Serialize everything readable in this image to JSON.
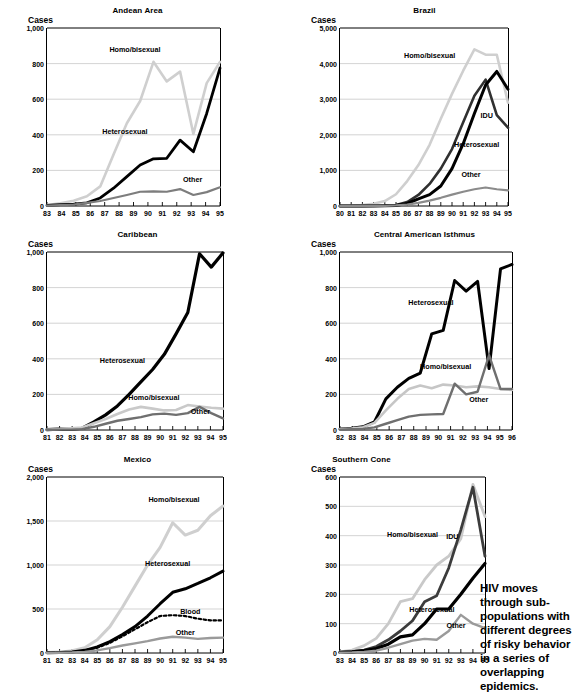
{
  "caption": {
    "text": "HIV moves through sub-populations with different degrees of risky behavior in a series of overlapping epidemics."
  },
  "axis_name_label": "Cases",
  "charts": [
    {
      "id": "andean-area",
      "title": "Andean Area",
      "ylabel": "Cases",
      "ylim": [
        0,
        1000
      ],
      "yticks": [
        0,
        200,
        400,
        600,
        800,
        1000
      ],
      "ytick_labels": [
        "0",
        "200",
        "400",
        "600",
        "800",
        "1,000"
      ],
      "xticks": [
        "83",
        "84",
        "85",
        "86",
        "87",
        "88",
        "89",
        "90",
        "91",
        "92",
        "93",
        "94",
        "95"
      ],
      "series": [
        {
          "name": "Homo/bisexual",
          "color": "#cfcfcf",
          "width": 2.6,
          "label_x": 89.1,
          "label_y": 880,
          "values": [
            5,
            15,
            30,
            55,
            110,
            290,
            465,
            590,
            810,
            700,
            755,
            405,
            690,
            810
          ]
        },
        {
          "name": "Heterosexual",
          "color": "#000000",
          "width": 2.8,
          "label_x": 88.4,
          "label_y": 420,
          "values": [
            3,
            8,
            10,
            18,
            45,
            100,
            165,
            230,
            265,
            268,
            370,
            305,
            520,
            775
          ]
        },
        {
          "name": "Other",
          "color": "#7d7d7d",
          "width": 2.2,
          "label_x": 93.1,
          "label_y": 150,
          "values": [
            2,
            5,
            8,
            18,
            28,
            45,
            62,
            80,
            82,
            80,
            95,
            62,
            78,
            105
          ]
        }
      ]
    },
    {
      "id": "brazil",
      "title": "Brazil",
      "ylabel": "Cases",
      "ylim": [
        0,
        5000
      ],
      "yticks": [
        0,
        1000,
        2000,
        3000,
        4000,
        5000
      ],
      "ytick_labels": [
        "0",
        "1,000",
        "2,000",
        "3,000",
        "4,000",
        "5,000"
      ],
      "xticks": [
        "80",
        "81",
        "82",
        "83",
        "84",
        "85",
        "86",
        "87",
        "88",
        "89",
        "90",
        "91",
        "92",
        "93",
        "94",
        "95"
      ],
      "series": [
        {
          "name": "Homo/bisexual",
          "color": "#cfcfcf",
          "width": 2.6,
          "label_x": 88.0,
          "label_y": 4230,
          "values": [
            5,
            10,
            25,
            60,
            140,
            330,
            700,
            1150,
            1720,
            2450,
            3150,
            3800,
            4400,
            4250,
            4250,
            2900
          ]
        },
        {
          "name": "IDU",
          "color": "#303030",
          "width": 2.6,
          "label_x": 93.1,
          "label_y": 2550,
          "values": [
            0,
            0,
            2,
            5,
            12,
            25,
            110,
            310,
            620,
            1050,
            1600,
            2350,
            3100,
            3550,
            2550,
            2200
          ]
        },
        {
          "name": "Heterosexual",
          "color": "#000000",
          "width": 3.0,
          "label_x": 92.2,
          "label_y": 1730,
          "values": [
            0,
            0,
            0,
            2,
            5,
            15,
            70,
            200,
            320,
            560,
            1050,
            1750,
            2600,
            3400,
            3780,
            3280
          ]
        },
        {
          "name": "Other",
          "color": "#8b8b8b",
          "width": 2.2,
          "label_x": 91.7,
          "label_y": 900,
          "values": [
            0,
            0,
            0,
            2,
            5,
            15,
            40,
            90,
            150,
            230,
            320,
            400,
            470,
            520,
            470,
            440
          ]
        }
      ]
    },
    {
      "id": "caribbean",
      "title": "Caribbean",
      "ylabel": "Cases",
      "ylim": [
        0,
        1000
      ],
      "yticks": [
        0,
        200,
        400,
        600,
        800,
        1000
      ],
      "ytick_labels": [
        "0",
        "200",
        "400",
        "600",
        "800",
        "1,000"
      ],
      "xticks": [
        "81",
        "82",
        "83",
        "84",
        "85",
        "86",
        "87",
        "88",
        "89",
        "90",
        "91",
        "92",
        "93",
        "94",
        "95"
      ],
      "series": [
        {
          "name": "Heterosexual",
          "color": "#000000",
          "width": 3.2,
          "label_x": 87.0,
          "label_y": 395,
          "values": [
            2,
            5,
            3,
            10,
            45,
            85,
            135,
            200,
            270,
            340,
            425,
            540,
            660,
            990,
            915,
            995
          ]
        },
        {
          "name": "Homo/bisexual",
          "color": "#c9c9c9",
          "width": 2.6,
          "label_x": 89.5,
          "label_y": 185,
          "values": [
            2,
            6,
            10,
            14,
            38,
            62,
            90,
            115,
            130,
            120,
            110,
            112,
            140,
            132,
            125,
            120
          ]
        },
        {
          "name": "Other",
          "color": "#6f6f6f",
          "width": 2.4,
          "label_x": 93.2,
          "label_y": 105,
          "values": [
            1,
            2,
            2,
            5,
            18,
            35,
            52,
            62,
            72,
            88,
            92,
            85,
            95,
            130,
            95,
            65
          ]
        }
      ]
    },
    {
      "id": "central-american-isthmus",
      "title": "Central American Isthmus",
      "ylabel": "Cases",
      "ylim": [
        0,
        1000
      ],
      "yticks": [
        0,
        200,
        400,
        600,
        800,
        1000
      ],
      "ytick_labels": [
        "0",
        "200",
        "400",
        "600",
        "800",
        "1,000"
      ],
      "xticks": [
        "82",
        "83",
        "84",
        "85",
        "86",
        "87",
        "88",
        "89",
        "90",
        "91",
        "92",
        "93",
        "94",
        "95",
        "96"
      ],
      "series": [
        {
          "name": "Heterosexual",
          "color": "#000000",
          "width": 3.0,
          "label_x": 89.4,
          "label_y": 720,
          "values": [
            5,
            10,
            18,
            45,
            175,
            240,
            290,
            320,
            540,
            560,
            840,
            780,
            835,
            345,
            905,
            930
          ]
        },
        {
          "name": "Homo/bisexual",
          "color": "#c6c6c6",
          "width": 2.6,
          "label_x": 90.6,
          "label_y": 360,
          "values": [
            5,
            8,
            15,
            40,
            110,
            175,
            230,
            250,
            235,
            255,
            250,
            240,
            245,
            240,
            230,
            225
          ]
        },
        {
          "name": "Other",
          "color": "#6f6f6f",
          "width": 2.4,
          "label_x": 93.3,
          "label_y": 175,
          "values": [
            2,
            4,
            6,
            15,
            35,
            55,
            75,
            85,
            88,
            90,
            260,
            200,
            215,
            420,
            230,
            230
          ]
        }
      ]
    },
    {
      "id": "mexico",
      "title": "Mexico",
      "ylabel": "Cases",
      "ylim": [
        0,
        2000
      ],
      "yticks": [
        0,
        500,
        1000,
        1500,
        2000
      ],
      "ytick_labels": [
        "0",
        "500",
        "1,000",
        "1,500",
        "2,000"
      ],
      "xticks": [
        "81",
        "82",
        "83",
        "84",
        "85",
        "86",
        "87",
        "88",
        "89",
        "90",
        "91",
        "92",
        "93",
        "94",
        "95"
      ],
      "series": [
        {
          "name": "Homo/bisexual",
          "color": "#cfcfcf",
          "width": 3.0,
          "label_x": 91.1,
          "label_y": 1750,
          "values": [
            5,
            10,
            25,
            60,
            150,
            300,
            520,
            760,
            1000,
            1200,
            1480,
            1340,
            1395,
            1560,
            1670
          ]
        },
        {
          "name": "Heterosexual",
          "color": "#000000",
          "width": 3.0,
          "label_x": 90.6,
          "label_y": 1020,
          "values": [
            2,
            5,
            12,
            30,
            70,
            130,
            210,
            300,
            420,
            560,
            690,
            730,
            790,
            855,
            930
          ]
        },
        {
          "name": "Blood",
          "color": "#000000",
          "width": 2.2,
          "dashed": true,
          "label_x": 92.4,
          "label_y": 480,
          "values": [
            2,
            4,
            10,
            25,
            60,
            115,
            190,
            270,
            350,
            420,
            430,
            420,
            390,
            370,
            370
          ]
        },
        {
          "name": "Other",
          "color": "#9a9a9a",
          "width": 2.4,
          "label_x": 92.0,
          "label_y": 240,
          "values": [
            1,
            2,
            5,
            12,
            30,
            55,
            85,
            110,
            135,
            165,
            185,
            175,
            160,
            170,
            175
          ]
        }
      ]
    },
    {
      "id": "southern-cone",
      "title": "Southern Cone",
      "ylabel": "Cases",
      "ylim": [
        0,
        600
      ],
      "yticks": [
        0,
        100,
        200,
        300,
        400,
        500,
        600
      ],
      "ytick_labels": [
        "0",
        "100",
        "200",
        "300",
        "400",
        "500",
        "600"
      ],
      "xticks": [
        "83",
        "84",
        "85",
        "86",
        "87",
        "88",
        "89",
        "90",
        "91",
        "92",
        "93",
        "94",
        "95"
      ],
      "series": [
        {
          "name": "Homo/bisexual",
          "color": "#c9c9c9",
          "width": 2.8,
          "label_x": 89.0,
          "label_y": 405,
          "values": [
            4,
            10,
            25,
            50,
            100,
            175,
            185,
            250,
            300,
            330,
            390,
            575,
            465
          ]
        },
        {
          "name": "IDU",
          "color": "#3c3c3c",
          "width": 2.8,
          "label_x": 92.3,
          "label_y": 400,
          "values": [
            2,
            5,
            10,
            22,
            45,
            75,
            110,
            175,
            195,
            290,
            420,
            565,
            330
          ]
        },
        {
          "name": "Heterosexual",
          "color": "#000000",
          "width": 3.2,
          "label_x": 90.6,
          "label_y": 150,
          "values": [
            2,
            4,
            8,
            15,
            30,
            55,
            62,
            100,
            150,
            150,
            200,
            255,
            305
          ]
        },
        {
          "name": "Other",
          "color": "#9a9a9a",
          "width": 2.4,
          "label_x": 92.6,
          "label_y": 95,
          "values": [
            1,
            2,
            4,
            8,
            18,
            30,
            42,
            48,
            45,
            75,
            130,
            100,
            85
          ]
        }
      ]
    }
  ]
}
